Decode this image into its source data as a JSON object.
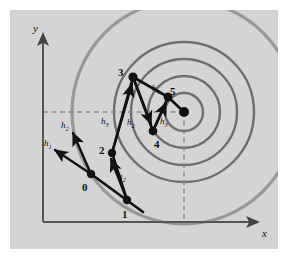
{
  "figure": {
    "background_color": "#d4d4d4",
    "page_color": "#ffffff",
    "ink_color": "#111111",
    "contour_color": "#6e6e6e",
    "axis_color": "#555555",
    "dash_color": "#8a8a8a"
  },
  "axes": {
    "x_label": "x",
    "y_label": "y",
    "origin": [
      43,
      222
    ],
    "x_axis_end": [
      262,
      222
    ],
    "y_axis_top": [
      43,
      30
    ]
  },
  "contours": {
    "type": "concentric-circles",
    "center": [
      184,
      112
    ],
    "radii": [
      19,
      36,
      53,
      70
    ],
    "count": 4,
    "outer_arc_radius": 112
  },
  "center_point": {
    "label": "",
    "position": [
      184,
      112
    ]
  },
  "points": [
    {
      "label": "0",
      "x": 91,
      "y": 174,
      "label_x": 82,
      "label_y": 189
    },
    {
      "label": "1",
      "x": 127,
      "y": 200,
      "label_x": 122,
      "label_y": 216
    },
    {
      "label": "2",
      "x": 112,
      "y": 153,
      "label_x": 101,
      "label_y": 152
    },
    {
      "label": "3",
      "x": 133,
      "y": 77,
      "label_x": 120,
      "label_y": 74
    },
    {
      "label": "4",
      "x": 153,
      "y": 131,
      "label_x": 155,
      "label_y": 145
    },
    {
      "label": "5",
      "x": 168,
      "y": 97,
      "label_x": 171,
      "label_y": 93
    }
  ],
  "step_labels": [
    {
      "text": "h",
      "sub": "1",
      "x": 47,
      "y": 143
    },
    {
      "text": "h",
      "sub": "2",
      "x": 63,
      "y": 126
    },
    {
      "text": "h",
      "sub": "2",
      "x": 120,
      "y": 176
    },
    {
      "text": "h",
      "sub": "3",
      "x": 103,
      "y": 121
    },
    {
      "text": "h",
      "sub": "2",
      "x": 129,
      "y": 122
    },
    {
      "text": "h",
      "sub": "4",
      "x": 155,
      "y": 89
    },
    {
      "text": "h",
      "sub": "3",
      "x": 162,
      "y": 122
    }
  ],
  "arrows": [
    {
      "name": "h1-from-0",
      "from": [
        91,
        174
      ],
      "to": [
        54,
        149
      ]
    },
    {
      "name": "h2-from-0",
      "from": [
        91,
        174
      ],
      "to": [
        72,
        131
      ]
    },
    {
      "name": "h2-from-1",
      "from": [
        127,
        200
      ],
      "to": [
        110,
        157
      ]
    },
    {
      "name": "h3-from-2",
      "from": [
        112,
        153
      ],
      "to": [
        132,
        81
      ]
    },
    {
      "name": "h2-from-3",
      "from": [
        133,
        77
      ],
      "to": [
        151,
        126
      ]
    },
    {
      "name": "h3-from-4",
      "from": [
        153,
        131
      ],
      "to": [
        167,
        101
      ]
    }
  ],
  "segments": [
    {
      "name": "seg-0-1",
      "from": [
        91,
        174
      ],
      "to": [
        127,
        200
      ]
    },
    {
      "name": "seg-1-2",
      "from": [
        127,
        200
      ],
      "to": [
        112,
        153
      ]
    },
    {
      "name": "seg-2-3",
      "from": [
        112,
        153
      ],
      "to": [
        133,
        77
      ]
    },
    {
      "name": "seg-3-4",
      "from": [
        133,
        77
      ],
      "to": [
        153,
        131
      ]
    },
    {
      "name": "seg-3-5",
      "from": [
        133,
        77
      ],
      "to": [
        168,
        97
      ]
    },
    {
      "name": "seg-4-5",
      "from": [
        153,
        131
      ],
      "to": [
        168,
        97
      ]
    },
    {
      "name": "seg-5-center",
      "from": [
        168,
        97
      ],
      "to": [
        184,
        112
      ]
    }
  ],
  "dashed_lines": [
    {
      "name": "horizontal-reference",
      "from": [
        43,
        112
      ],
      "to": [
        184,
        112
      ]
    },
    {
      "name": "vertical-reference",
      "from": [
        184,
        112
      ],
      "to": [
        184,
        222
      ]
    }
  ]
}
